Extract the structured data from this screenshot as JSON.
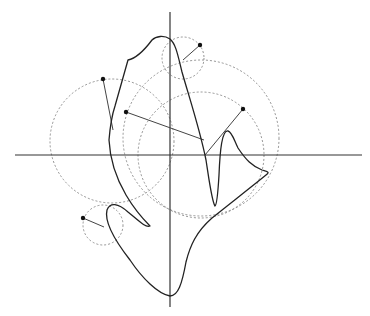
{
  "diagram": {
    "type": "fourier-epicycles",
    "colors": {
      "background": "#ffffff",
      "axis": "#333333",
      "curve": "#222222",
      "circle": "#888888",
      "radius": "#444444",
      "dot": "#111111"
    },
    "axes": {
      "x": {
        "x1": 15,
        "y1": 155,
        "x2": 362,
        "y2": 155
      },
      "y": {
        "x1": 170,
        "y1": 12,
        "x2": 170,
        "y2": 307
      }
    },
    "circles": [
      {
        "name": "large-circle-b",
        "cx": 201,
        "cy": 138,
        "r": 78
      },
      {
        "name": "large-circle-c",
        "cx": 201,
        "cy": 155,
        "r": 63
      },
      {
        "name": "left-circle",
        "cx": 112,
        "cy": 141,
        "r": 62
      },
      {
        "name": "top-small-circle",
        "cx": 183,
        "cy": 58,
        "r": 21
      },
      {
        "name": "bottom-left-small-circle",
        "cx": 103,
        "cy": 225,
        "r": 20
      }
    ],
    "radii": [
      {
        "name": "radius-b",
        "x1": 126,
        "y1": 112,
        "x2": 204,
        "y2": 140
      },
      {
        "name": "radius-c",
        "x1": 243,
        "y1": 109,
        "x2": 205,
        "y2": 155
      },
      {
        "name": "radius-left",
        "x1": 103,
        "y1": 79,
        "x2": 113,
        "y2": 130
      },
      {
        "name": "radius-top",
        "x1": 200,
        "y1": 45,
        "x2": 183,
        "y2": 60
      },
      {
        "name": "radius-bottom-left",
        "x1": 83,
        "y1": 218,
        "x2": 104,
        "y2": 227
      }
    ],
    "dots": [
      {
        "name": "dot-b",
        "cx": 126,
        "cy": 112
      },
      {
        "name": "dot-c",
        "cx": 243,
        "cy": 109
      },
      {
        "name": "dot-left",
        "cx": 103,
        "cy": 79
      },
      {
        "name": "dot-top",
        "cx": 200,
        "cy": 45
      },
      {
        "name": "dot-bottom-left",
        "cx": 83,
        "cy": 218
      }
    ],
    "curve_path": "M 170 39 C 164 35 156 36 152 40 C 146 48 138 58 128 60 L 115 106 C 111 118 110 128 109 140 C 110 160 116 178 126 195 C 136 212 146 222 150 226 C 146 228 140 222 128 212 C 118 203 110 202 107 210 C 104 222 116 242 130 260 C 142 278 158 294 170 296 C 178 296 182 284 186 262 C 190 246 196 232 212 218 C 232 202 250 188 266 175 C 270 172 268 172 262 170 C 252 166 246 160 238 148 C 234 140 232 132 228 131 C 222 130 220 150 219 175 C 218 192 217 205 215 206 C 212 202 210 186 206 160 C 200 130 190 100 182 72 C 178 56 176 44 170 39 Z"
  }
}
